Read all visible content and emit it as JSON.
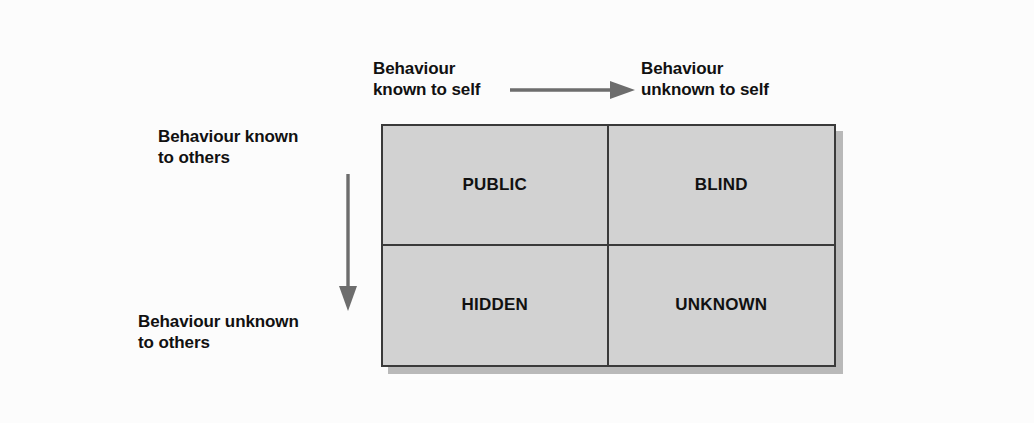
{
  "diagram": {
    "type": "2x2-matrix",
    "background_color": "#fcfcfc",
    "box_fill_color": "#d2d2d2",
    "box_border_color": "#3a3a3a",
    "shadow_color": "#b9b9b9",
    "arrow_color": "#6d6d6d",
    "text_color": "#111111"
  },
  "axes": {
    "top": {
      "left_label": "Behaviour\nknown to self",
      "right_label": "Behaviour\nunknown to self",
      "arrow_direction": "right",
      "arrow_name": "horizontal-arrow"
    },
    "left": {
      "top_label": "Behaviour known\nto others",
      "bottom_label": "Behaviour unknown\nto others",
      "arrow_direction": "down",
      "arrow_name": "vertical-arrow"
    }
  },
  "quadrants": [
    {
      "key": "public",
      "label": "PUBLIC",
      "row": "known-to-others",
      "col": "known-to-self"
    },
    {
      "key": "blind",
      "label": "BLIND",
      "row": "known-to-others",
      "col": "unknown-to-self"
    },
    {
      "key": "hidden",
      "label": "HIDDEN",
      "row": "unknown-to-others",
      "col": "known-to-self"
    },
    {
      "key": "unknown",
      "label": "UNKNOWN",
      "row": "unknown-to-others",
      "col": "unknown-to-self"
    }
  ]
}
